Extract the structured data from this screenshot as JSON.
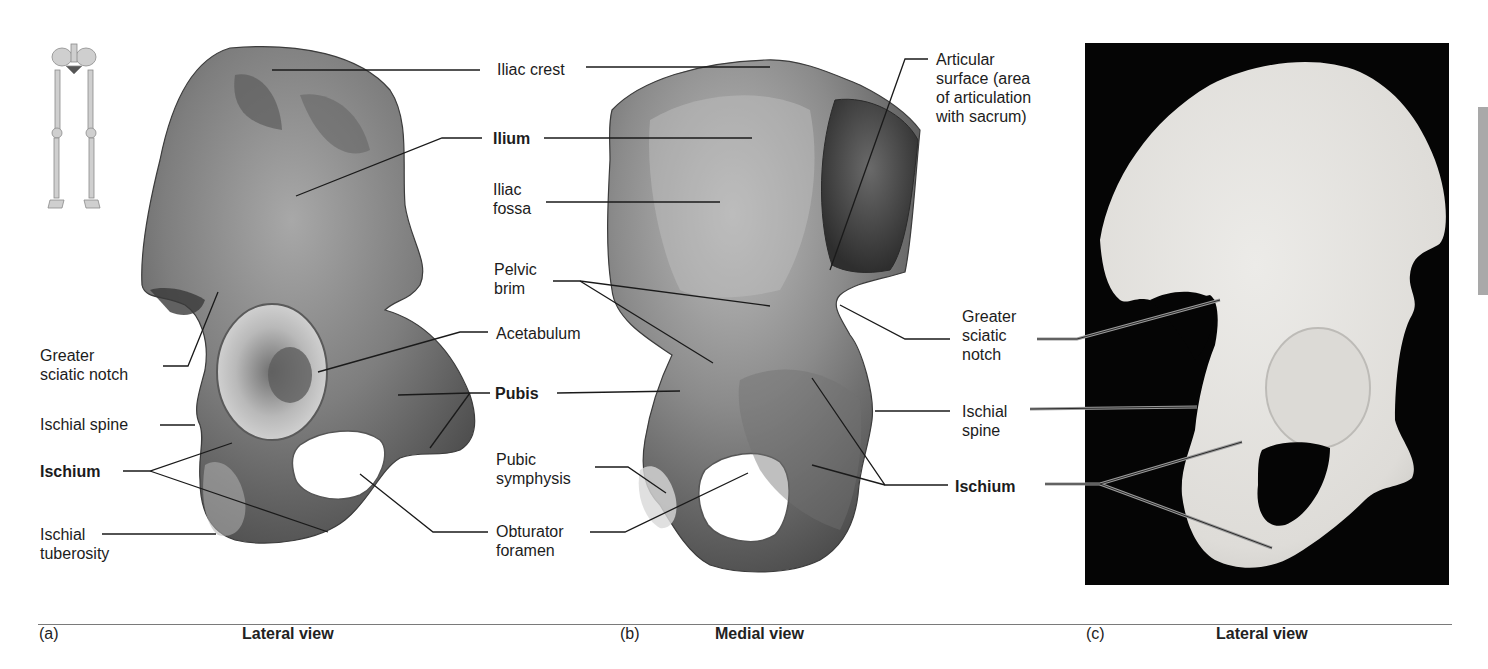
{
  "figure": {
    "panels": [
      {
        "id": "a",
        "letter": "(a)",
        "view": "Lateral view",
        "labels": {
          "greater_sciatic_notch": "Greater\nsciatic notch",
          "greater_sciatic_notch_l1": "Greater",
          "greater_sciatic_notch_l2": "sciatic notch",
          "ischial_spine": "Ischial spine",
          "ischium": "Ischium",
          "ischial_tuberosity_l1": "Ischial",
          "ischial_tuberosity_l2": "tuberosity"
        }
      },
      {
        "id": "b",
        "letter": "(b)",
        "view": "Medial view",
        "labels": {
          "iliac_crest": "Iliac crest",
          "ilium": "Ilium",
          "iliac_fossa_l1": "Iliac",
          "iliac_fossa_l2": "fossa",
          "pelvic_brim_l1": "Pelvic",
          "pelvic_brim_l2": "brim",
          "acetabulum": "Acetabulum",
          "pubis": "Pubis",
          "pubic_symphysis_l1": "Pubic",
          "pubic_symphysis_l2": "symphysis",
          "obturator_foramen_l1": "Obturator",
          "obturator_foramen_l2": "foramen",
          "articular_surface_l1": "Articular",
          "articular_surface_l2": "surface (area",
          "articular_surface_l3": "of articulation",
          "articular_surface_l4": "with sacrum)"
        }
      },
      {
        "id": "c",
        "letter": "(c)",
        "view": "Lateral view",
        "labels": {
          "greater_sciatic_notch_l1": "Greater",
          "greater_sciatic_notch_l2": "sciatic",
          "greater_sciatic_notch_l3": "notch",
          "ischial_spine_l1": "Ischial",
          "ischial_spine_l2": "spine",
          "ischium": "Ischium"
        }
      }
    ],
    "icons": {
      "skeleton_locator": "skeleton-icon"
    },
    "colors": {
      "bone_illustration_dark": "#5a5a5a",
      "bone_illustration_mid": "#8a8a8a",
      "bone_illustration_light": "#c8c8c8",
      "photo_background": "#050505",
      "photo_bone": "#e4e4e2",
      "leader_line": "#1a1a1a",
      "side_tab": "#a9a9a9",
      "rule": "#7a7a7a"
    }
  }
}
